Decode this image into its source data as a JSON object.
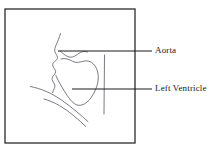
{
  "figure": {
    "type": "anatomical-line-drawing",
    "background_color": "#ffffff",
    "frame": {
      "name": "figure-border-box",
      "x": 5,
      "y": 9,
      "width": 130,
      "height": 134,
      "stroke_color": "#2b2b2b",
      "stroke_width": 1.3,
      "fill": "#ffffff"
    },
    "drawing": {
      "stroke_color": "#6b6b73",
      "stroke_width": 0.9,
      "strokes": [
        {
          "name": "ascending-aorta-left-wall",
          "path": "M 60.5,33.5 C 59.2,38.0 57.6,41.6 56.2,44.8 C 55.0,47.6 54.3,49.7 54.9,51.6 C 55.6,53.9 57.2,55.2 57.5,57.2 C 57.8,59.2 56.0,60.4 54.6,61.6 C 53.1,62.9 52.3,64.3 52.8,66.0 C 53.3,67.8 55.0,68.8 55.5,70.6 C 56.0,72.4 55.0,73.8 53.9,75.1 C 52.7,76.5 51.8,77.9 52.1,79.6 C 52.4,81.3 53.7,82.4 54.4,83.9 C 55.1,85.4 55.0,86.8 54.4,88.2 C 53.8,89.7 52.9,91.0 52.6,92.6"
        },
        {
          "name": "aortic-arch-inner-curve",
          "path": "M 60.0,50.8 C 62.2,53.0 64.6,55.1 67.2,56.3 C 69.7,57.5 72.0,57.5 74.2,56.4 C 76.5,55.2 78.4,53.5 80.6,52.4 C 83.0,51.2 85.4,51.0 87.5,52.0"
        },
        {
          "name": "left-ventricle-outline",
          "path": "M 61.0,59.0 C 63.8,58.2 66.6,58.6 69.0,59.6 C 71.5,60.6 73.6,62.2 76.2,62.4 C 78.9,62.6 81.6,61.5 84.2,61.1 C 86.9,60.6 89.5,61.0 91.8,62.6 C 94.1,64.2 95.8,66.7 96.9,69.6 C 98.0,72.5 98.4,75.8 98.2,79.0 C 98.0,82.3 97.2,85.5 96.0,88.6 C 94.8,91.7 93.2,94.6 91.4,97.2 C 89.5,99.9 87.3,102.2 84.8,103.7 C 82.3,105.2 79.5,105.8 77.0,105.0 C 74.5,104.2 72.4,102.2 70.4,99.8 C 68.3,97.3 66.4,94.4 64.6,91.5 C 62.8,88.6 61.1,85.7 59.6,83.0 C 58.1,80.3 56.8,77.9 55.9,75.5"
        },
        {
          "name": "diaphragm-upper-line",
          "path": "M 30.5,86.5 C 36.0,87.6 41.5,89.3 46.8,91.7 C 52.2,94.1 57.3,97.2 62.2,100.5 C 67.1,103.9 71.7,107.6 76.1,111.2 C 80.5,114.8 84.6,118.4 88.0,121.6"
        },
        {
          "name": "diaphragm-lower-line",
          "path": "M 44.0,99.0 C 49.4,100.5 54.6,102.8 59.6,105.7 C 64.7,108.6 69.5,112.1 73.9,115.8 C 78.3,119.4 82.3,123.2 85.7,126.5"
        },
        {
          "name": "right-vertical-border-line",
          "path": "M 104.5,55.0 L 104.0,114.0"
        }
      ]
    },
    "leaders": [
      {
        "name": "leader-line-aorta",
        "x1": 58,
        "y1": 51,
        "x2": 152,
        "y2": 51,
        "stroke_color": "#1b1b20",
        "stroke_width": 1.0
      },
      {
        "name": "leader-line-left-ventricle",
        "x1": 72,
        "y1": 89,
        "x2": 152,
        "y2": 89,
        "stroke_color": "#1b1b20",
        "stroke_width": 1.0
      }
    ],
    "labels": [
      {
        "name": "label-aorta",
        "text": "Aorta",
        "color": "#14161c"
      },
      {
        "name": "label-left-ventricle",
        "text": "Left Ventricle",
        "color": "#14161c"
      }
    ]
  }
}
